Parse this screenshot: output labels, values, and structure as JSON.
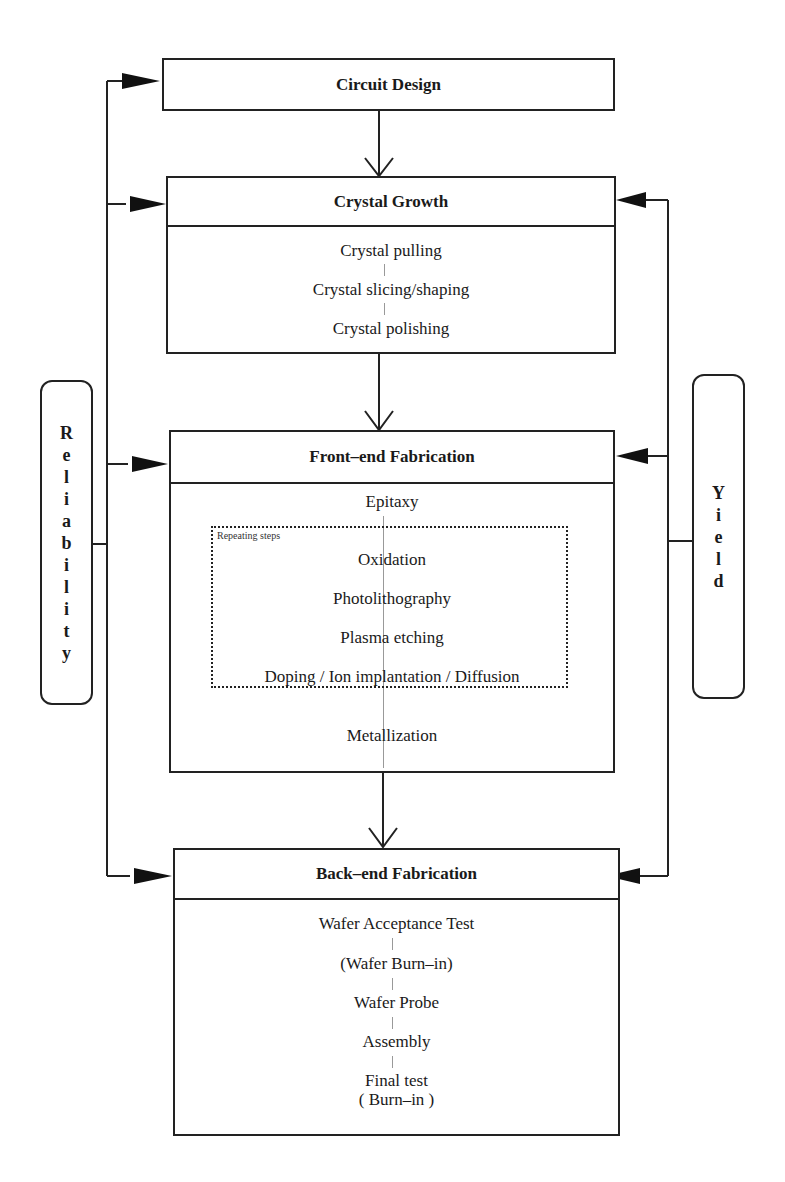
{
  "diagram": {
    "stages": [
      {
        "id": "circuit-design",
        "title": "Circuit Design",
        "steps": []
      },
      {
        "id": "crystal-growth",
        "title": "Crystal Growth",
        "steps": [
          "Crystal pulling",
          "Crystal slicing/shaping",
          "Crystal polishing"
        ]
      },
      {
        "id": "front-end",
        "title": "Front–end Fabrication",
        "steps_before": [
          "Epitaxy"
        ],
        "repeating_group": {
          "label": "Repeating steps",
          "steps": [
            "Oxidation",
            "Photolithography",
            "Plasma etching",
            "Doping / Ion implantation / Diffusion"
          ]
        },
        "steps_after": [
          "Metallization"
        ]
      },
      {
        "id": "back-end",
        "title": "Back–end Fabrication",
        "steps": [
          "Wafer Acceptance Test",
          "(Wafer Burn–in)",
          "Wafer Probe",
          "Assembly",
          "Final test",
          "( Burn–in )"
        ]
      }
    ],
    "feedback_loops": {
      "left": {
        "label": "Reliability",
        "letters": [
          "R",
          "e",
          "l",
          "i",
          "a",
          "b",
          "i",
          "l",
          "i",
          "t",
          "y"
        ],
        "targets": [
          "Circuit Design",
          "Crystal Growth",
          "Front–end Fabrication",
          "Back–end Fabrication"
        ]
      },
      "right": {
        "label": "Yield",
        "letters": [
          "Y",
          "i",
          "e",
          "l",
          "d"
        ],
        "targets": [
          "Crystal Growth",
          "Front–end Fabrication",
          "Back–end Fabrication"
        ]
      }
    },
    "flow": [
      "Circuit Design",
      "Crystal Growth",
      "Front–end Fabrication",
      "Back–end Fabrication"
    ]
  }
}
